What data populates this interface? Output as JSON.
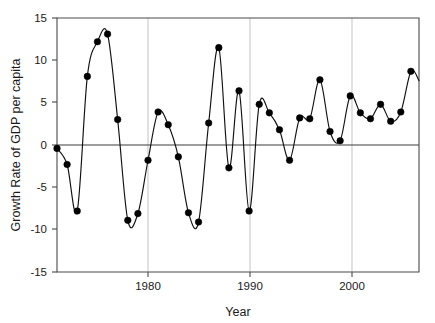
{
  "chart_data": {
    "type": "line",
    "title": "",
    "xlabel": "Year",
    "ylabel": "Growth Rate of GDP per capita",
    "xlim": [
      1971,
      2006.8
    ],
    "ylim": [
      -15,
      15
    ],
    "xticks": [
      1980,
      1990,
      2000
    ],
    "xtick_labels": [
      "1980",
      "1990",
      "2000"
    ],
    "yticks": [
      15,
      10,
      5,
      0,
      -5,
      -10,
      -15
    ],
    "ytick_labels": [
      "15",
      "10",
      "5",
      "0",
      "-5",
      "-10",
      "-15"
    ],
    "grid": "vertical-only",
    "legend": "none",
    "zero_reference_line": true,
    "marker": "filled-circle",
    "line_style": "smooth-spline",
    "x": [
      1971,
      1972,
      1973,
      1974,
      1975,
      1976,
      1977,
      1978,
      1979,
      1980,
      1981,
      1982,
      1983,
      1984,
      1985,
      1986,
      1987,
      1988,
      1989,
      1990,
      1991,
      1992,
      1993,
      1994,
      1995,
      1996,
      1997,
      1998,
      1999,
      2000,
      2001,
      2002,
      2003,
      2004,
      2005,
      2006
    ],
    "values": [
      -0.4,
      -2.3,
      -7.8,
      8.1,
      12.2,
      13.1,
      3.0,
      -8.9,
      -8.1,
      -1.8,
      3.9,
      2.4,
      -1.4,
      -8.0,
      -9.1,
      2.6,
      11.5,
      -2.7,
      6.4,
      -7.8,
      4.8,
      3.8,
      1.8,
      -1.8,
      3.2,
      3.1,
      7.7,
      1.6,
      0.5,
      5.8,
      3.8,
      3.1,
      4.8,
      2.8,
      3.9,
      8.7
    ],
    "last_partial_point": {
      "x": 2006.8,
      "y": 7.6
    }
  },
  "axes": {
    "x_title": "Year",
    "y_title": "Growth Rate of GDP per capita"
  }
}
